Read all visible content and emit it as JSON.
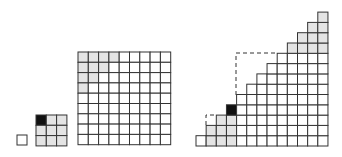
{
  "colors": {
    "background": "#ffffff",
    "line": "#333333",
    "shaded": "#e4e4e4",
    "black": "#111111",
    "empty": "#ffffff"
  },
  "figures": [
    {
      "id": "single-square",
      "type": "grid",
      "x": 17,
      "y": 135,
      "cols": 1,
      "rows": 1,
      "cell": 10,
      "cells": [
        [
          0
        ]
      ]
    },
    {
      "id": "grid-3x3",
      "type": "grid",
      "x": 36,
      "y": 115,
      "cols": 3,
      "rows": 3,
      "cell": 10.3,
      "cells": [
        [
          2,
          1,
          1
        ],
        [
          1,
          1,
          1
        ],
        [
          1,
          1,
          1
        ]
      ]
    },
    {
      "id": "grid-9x9",
      "type": "grid",
      "x": 78,
      "y": 52,
      "cols": 9,
      "rows": 9,
      "cell": 10.3,
      "cells": [
        [
          1,
          1,
          1,
          1,
          0,
          0,
          0,
          0,
          0
        ],
        [
          1,
          1,
          1,
          0,
          0,
          0,
          0,
          0,
          0
        ],
        [
          1,
          1,
          0,
          0,
          0,
          0,
          0,
          0,
          0
        ],
        [
          1,
          0,
          0,
          0,
          0,
          0,
          0,
          0,
          0
        ],
        [
          0,
          0,
          0,
          0,
          0,
          0,
          0,
          0,
          0
        ],
        [
          0,
          0,
          0,
          0,
          0,
          0,
          0,
          0,
          0
        ],
        [
          0,
          0,
          0,
          0,
          0,
          0,
          0,
          0,
          0
        ],
        [
          0,
          0,
          0,
          0,
          0,
          0,
          0,
          0,
          0
        ],
        [
          0,
          0,
          0,
          0,
          0,
          0,
          0,
          0,
          0
        ]
      ]
    },
    {
      "id": "staircase",
      "type": "staircase",
      "x": 196,
      "bottom": 146,
      "cols": 13,
      "cellw": 10.15,
      "cellh": 10.3,
      "heights": [
        1,
        2,
        3,
        4,
        5,
        6,
        7,
        8,
        9,
        10,
        11,
        12,
        13
      ],
      "shaded": [
        {
          "col": 1,
          "rows": [
            0,
            1
          ]
        },
        {
          "col": 2,
          "rows": [
            0,
            1,
            2
          ]
        },
        {
          "col": 3,
          "rows": [
            0,
            1,
            2
          ]
        },
        {
          "col": 9,
          "rows": [
            9
          ]
        },
        {
          "col": 10,
          "rows": [
            9,
            10
          ]
        },
        {
          "col": 11,
          "rows": [
            9,
            10,
            11
          ]
        },
        {
          "col": 12,
          "rows": [
            9,
            10,
            11,
            12
          ]
        }
      ],
      "black": [
        {
          "col": 3,
          "row": 3
        }
      ],
      "dashed": [
        {
          "points": [
            [
              206,
              125
            ],
            [
              206,
              115
            ],
            [
              216,
              115
            ]
          ]
        },
        {
          "points": [
            [
              236,
              95
            ],
            [
              236,
              53
            ],
            [
              277,
              53
            ]
          ]
        }
      ]
    }
  ]
}
